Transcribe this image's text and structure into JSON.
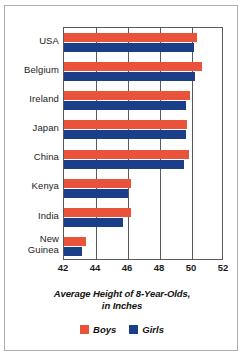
{
  "chart_data": {
    "type": "bar",
    "orientation": "horizontal",
    "title": "",
    "xlabel": "Average Height of 8-Year-Olds, in Inches",
    "xlabel_line1": "Average Height of 8-Year-Olds,",
    "xlabel_line2": "in Inches",
    "ylabel": "",
    "categories": [
      "USA",
      "Belgium",
      "Ireland",
      "Japan",
      "China",
      "Kenya",
      "India",
      "New Guinea"
    ],
    "category_labels": [
      [
        "USA"
      ],
      [
        "Belgium"
      ],
      [
        "Ireland"
      ],
      [
        "Japan"
      ],
      [
        "China"
      ],
      [
        "Kenya"
      ],
      [
        "India"
      ],
      [
        "New",
        "Guinea"
      ]
    ],
    "series": [
      {
        "name": "Boys",
        "color": "#E8533A",
        "values": [
          50.3,
          50.6,
          49.9,
          49.7,
          49.8,
          46.2,
          46.2,
          43.4
        ]
      },
      {
        "name": "Girls",
        "color": "#1A3E87",
        "values": [
          50.1,
          50.2,
          49.6,
          49.6,
          49.5,
          46.0,
          45.7,
          43.1
        ]
      }
    ],
    "xlim": [
      42,
      52
    ],
    "xticks": [
      42,
      44,
      46,
      48,
      50,
      52
    ],
    "xtick_labels": [
      "42",
      "44",
      "46",
      "48",
      "50",
      "52"
    ],
    "grid": true,
    "grid_axis": "x",
    "legend": [
      "Boys",
      "Girls"
    ],
    "legend_position": "bottom-center"
  },
  "colors": {
    "boys": "#E8533A",
    "girls": "#1A3E87",
    "axis": "#5a5a5a",
    "frame": "#aeaeae",
    "text": "#1c1c1c",
    "background": "#ffffff"
  }
}
